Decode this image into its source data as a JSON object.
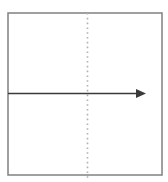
{
  "figure": {
    "title": "",
    "canvas": {
      "width": 168,
      "height": 182,
      "background": "#ffffff"
    },
    "frame": {
      "name": "outer-rectangle",
      "x": 8,
      "y": 13,
      "width": 154,
      "height": 162,
      "stroke": "#808080",
      "stroke_width": 1.5,
      "fill": "none",
      "label": ""
    },
    "axis_of_symmetry": {
      "name": "vertical-dotted-line",
      "x": 87.5,
      "y_start": 13,
      "y_end": 180,
      "stroke": "#b0b0b0",
      "stroke_width": 1.6,
      "dash_pattern": "1.6 3.2",
      "label": ""
    },
    "arrow": {
      "name": "horizontal-arrow",
      "x_start": 8,
      "x_end": 146,
      "y": 93.5,
      "stroke": "#3a3a3a",
      "stroke_width": 1.6,
      "head_width": 10,
      "head_height": 9,
      "label": ""
    }
  }
}
